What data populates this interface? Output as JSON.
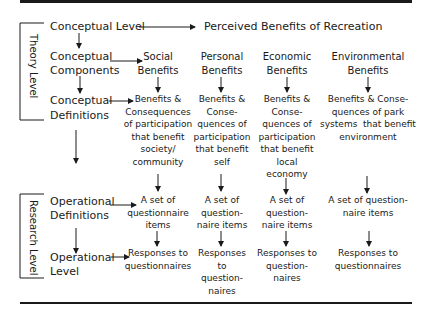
{
  "diagram": {
    "title_row": {
      "left": "Conceptual Level",
      "right": "Perceived Benefits of Recreation"
    },
    "bracket_labels": {
      "theory": "Theory Level",
      "research": "Research Level"
    },
    "rows": {
      "conceptual_components": [
        "Conceptual",
        "Components"
      ],
      "conceptual_definitions": [
        "Conceptual",
        "Definitions"
      ],
      "operational_definitions": [
        "Operational",
        "Definitions"
      ],
      "operational_level": [
        "Operational",
        "Level"
      ]
    },
    "columns": [
      {
        "name": "social",
        "heading": [
          "Social",
          "Benefits"
        ],
        "definition": [
          "Benefits &",
          "Consequences",
          "of participation",
          "that benefit",
          "society/",
          "community"
        ],
        "measure": [
          "A set of",
          "questionnaire",
          "items"
        ],
        "responses": [
          "Responses to",
          "questionnaires"
        ]
      },
      {
        "name": "personal",
        "heading": [
          "Personal",
          "Benefits"
        ],
        "definition": [
          "Benefits &",
          "Conse-",
          "quences of",
          "participation",
          "that benefit",
          "self"
        ],
        "measure": [
          "A set of",
          "question-",
          "naire items"
        ],
        "responses": [
          "Responses",
          "to",
          "question-",
          "naires"
        ]
      },
      {
        "name": "economic",
        "heading": [
          "Economic",
          "Benefits"
        ],
        "definition": [
          "Benefits &",
          "Conse-",
          "quences of",
          "participation",
          "that benefit",
          "local",
          "economy"
        ],
        "measure": [
          "A set of",
          "question-",
          "naire items"
        ],
        "responses": [
          "Responses to",
          "question-",
          "naires"
        ]
      },
      {
        "name": "environmental",
        "heading": [
          "Environmental",
          "Benefits"
        ],
        "definition": [
          "Benefits & Conse-",
          "quences of park",
          "systems  that benefit",
          "environment"
        ],
        "measure": [
          "A set of question-",
          "naire items"
        ],
        "responses": [
          "Responses to",
          "questionnaires"
        ]
      }
    ]
  }
}
